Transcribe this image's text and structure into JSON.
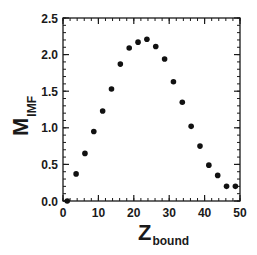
{
  "chart_data": {
    "type": "scatter",
    "title": "",
    "xlabel": "Z",
    "xlabel_sub": "bound",
    "ylabel": "M",
    "ylabel_sub": "IMF",
    "xlim": [
      0,
      50
    ],
    "ylim": [
      0.0,
      2.5
    ],
    "x_major_ticks": [
      0,
      10,
      20,
      30,
      40,
      50
    ],
    "x_tick_labels": [
      "0",
      "10",
      "20",
      "30",
      "40",
      "50"
    ],
    "x_minor_step": 2,
    "y_major_ticks": [
      0.0,
      0.5,
      1.0,
      1.5,
      2.0,
      2.5
    ],
    "y_tick_labels": [
      "0.0",
      "0.5",
      "1.0",
      "1.5",
      "2.0",
      "2.5"
    ],
    "y_minor_step": 0.1,
    "grid": false,
    "legend": null,
    "marker_color": "#111111",
    "series": [
      {
        "name": "M_IMF vs Z_bound",
        "x": [
          1.2,
          3.7,
          6.2,
          8.7,
          11.2,
          13.7,
          16.2,
          18.7,
          21.2,
          23.7,
          26.2,
          28.7,
          31.2,
          33.7,
          36.2,
          38.7,
          41.2,
          43.7,
          46.2,
          48.7
        ],
        "y": [
          0.0,
          0.37,
          0.65,
          0.95,
          1.23,
          1.53,
          1.87,
          2.09,
          2.17,
          2.21,
          2.11,
          1.94,
          1.63,
          1.35,
          1.02,
          0.75,
          0.49,
          0.35,
          0.2,
          0.2
        ]
      }
    ]
  },
  "labels": {
    "x_main": "Z",
    "x_sub": "bound",
    "y_main": "M",
    "y_sub": "IMF"
  }
}
